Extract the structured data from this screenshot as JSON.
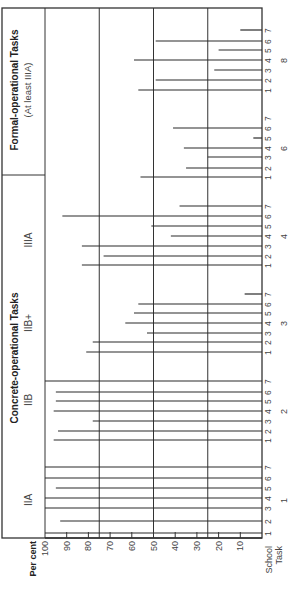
{
  "chart_data": {
    "type": "bar",
    "orientation": "rotated-90-ccw",
    "title": "",
    "ylabel": "Per cent",
    "xlabel": "School / Task",
    "ylim": [
      0,
      100
    ],
    "y_ticks": [
      100,
      90,
      80,
      70,
      60,
      50,
      40,
      30,
      20,
      10
    ],
    "gridlines_at": [
      75,
      50,
      25
    ],
    "schools": [
      "1",
      "2",
      "3",
      "4",
      "5",
      "6",
      "7"
    ],
    "groups": [
      {
        "heading": "Concrete-operational Tasks",
        "subheadings": [
          "IIA",
          "IIB",
          "IIB+",
          "IIIA"
        ]
      },
      {
        "heading": "Formal-operational Tasks",
        "subheading": "(At least IIIA)"
      }
    ],
    "series": [
      {
        "task": "1",
        "level": "IIA",
        "values": [
          100,
          93,
          100,
          100,
          95,
          100,
          100
        ]
      },
      {
        "task": "2",
        "level": "IIB",
        "values": [
          96,
          94,
          78,
          96,
          95,
          95,
          100
        ]
      },
      {
        "task": "3",
        "level": "IIB+",
        "values": [
          81,
          78,
          53,
          63,
          59,
          57,
          8
        ]
      },
      {
        "task": "4",
        "level": "IIIA",
        "values": [
          83,
          73,
          83,
          42,
          51,
          92,
          38
        ]
      },
      {
        "task": "6",
        "level": "Formal",
        "values": [
          56,
          35,
          25,
          36,
          4,
          41,
          0
        ]
      },
      {
        "task": "8",
        "level": "Formal",
        "values": [
          57,
          49,
          22,
          59,
          20,
          49,
          10
        ]
      }
    ]
  },
  "labels": {
    "per_cent": "Per cent",
    "school": "School",
    "task": "Task",
    "concrete_heading": "Concrete-operational Tasks",
    "formal_heading": "Formal-operational Tasks",
    "formal_sub": "(At least IIIA)",
    "level_IIA": "IIA",
    "level_IIB": "IIB",
    "level_IIBplus": "IIB+",
    "level_IIIA": "IIIA"
  }
}
